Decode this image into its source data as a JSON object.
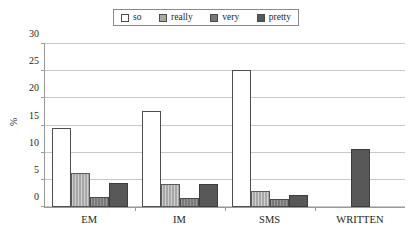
{
  "chart_data": {
    "type": "bar",
    "title": "",
    "subtitle": "",
    "xlabel": "",
    "ylabel": "%",
    "ylim": [
      0,
      30
    ],
    "ytick_step": 5,
    "yticks": [
      "30",
      "25",
      "20",
      "15",
      "10",
      "5",
      "0"
    ],
    "grid": true,
    "legend_position": "top-center",
    "categories": [
      "EM",
      "IM",
      "SMS",
      "WRITTEN"
    ],
    "series": [
      {
        "name": "so",
        "color": "#ffffff",
        "values": [
          14.6,
          17.7,
          25.2,
          0
        ]
      },
      {
        "name": "really",
        "color": "#a8a8a8",
        "values": [
          6.3,
          4.2,
          2.9,
          0
        ]
      },
      {
        "name": "very",
        "color": "#787878",
        "values": [
          1.9,
          1.6,
          1.5,
          0
        ]
      },
      {
        "name": "pretty",
        "color": "#585858",
        "values": [
          4.4,
          4.3,
          2.3,
          10.6
        ]
      }
    ]
  },
  "legend": {
    "entries": [
      {
        "label": "so"
      },
      {
        "label": "really"
      },
      {
        "label": "very"
      },
      {
        "label": "pretty"
      }
    ]
  }
}
